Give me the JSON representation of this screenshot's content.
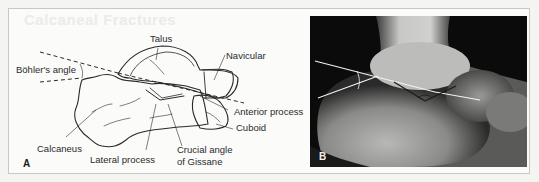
{
  "figure": {
    "ghost_text": "Calcaneal Fractures",
    "panel_a": {
      "letter": "A",
      "labels": {
        "talus": "Talus",
        "navicular": "Navicular",
        "bohlers_angle": "Böhler's angle",
        "anterior_process": "Anterior process",
        "cuboid": "Cuboid",
        "calcaneus": "Calcaneus",
        "lateral_process": "Lateral process",
        "crucial_angle_line1": "Crucial angle",
        "crucial_angle_line2": "of Gissane"
      }
    },
    "panel_b": {
      "letter": "B",
      "description": "Lateral radiograph of the hindfoot with Böhler's angle and crucial angle of Gissane drawn"
    },
    "colors": {
      "background": "#f4f4f2",
      "frame_border": "#c8c8c6",
      "line": "#2a2a2a",
      "xray_dark": "#0b0b0b"
    }
  }
}
